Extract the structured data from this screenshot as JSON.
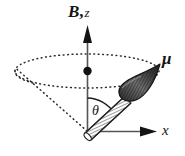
{
  "figure": {
    "background_color": "#ffffff",
    "ink_color": "#151515",
    "axis_color": "#555555",
    "labels": {
      "field_axis_vector": "B",
      "field_axis_separator": ",",
      "field_axis_scalar": "z",
      "moment_vector": "μ",
      "horizontal_axis": "x",
      "cone_angle": "θ"
    },
    "elements": {
      "z_axis_name": "z-axis-arrow",
      "x_axis_name": "x-axis-arrow",
      "mu_vector_name": "mu-vector-arrow",
      "cone_name": "precession-cone",
      "cone_base_ellipse_name": "cone-base-ellipse",
      "center_dot_name": "cone-center-dot",
      "angle_arc_name": "theta-angle-arc"
    },
    "geometry": {
      "origin": [
        87,
        131
      ],
      "z_axis_top": [
        87,
        25
      ],
      "x_axis_end": [
        156,
        131
      ],
      "ellipse_center": [
        87,
        71
      ],
      "ellipse_rx": 72,
      "ellipse_ry": 17,
      "mu_tip": [
        160,
        64
      ],
      "center_dot_radius": 4
    }
  }
}
